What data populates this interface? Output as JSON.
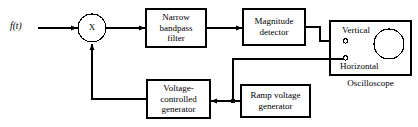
{
  "diagram": {
    "stroke_color": "#000000",
    "background_color": "#ffffff",
    "input_signal": {
      "label": "f(t)",
      "name": "input-signal-label"
    },
    "mixer": {
      "symbol": "X",
      "name": "mixer-multiplier"
    },
    "blocks": [
      {
        "id": "narrow-bandpass-filter",
        "label": "Narrow\nbandpass\nfilter"
      },
      {
        "id": "magnitude-detector",
        "label": "Magnitude\ndetector"
      },
      {
        "id": "ramp-voltage-generator",
        "label": "Ramp voltage\ngenerator"
      },
      {
        "id": "voltage-controlled-generator",
        "label": "Voltage-\ncontrolled\ngenerator"
      }
    ],
    "oscilloscope": {
      "caption": "Oscilloscope",
      "terminals": [
        {
          "id": "vertical-terminal",
          "label": "Vertical"
        },
        {
          "id": "horizontal-terminal",
          "label": "Horizontal"
        }
      ]
    }
  }
}
